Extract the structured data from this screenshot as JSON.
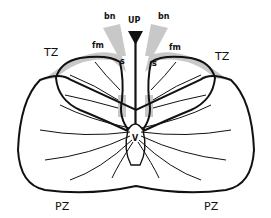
{
  "diagram": {
    "type": "anatomical-section",
    "labels": {
      "bn_left": "bn",
      "bn_right": "bn",
      "up": "UP",
      "tz_left": "TZ",
      "tz_right": "TZ",
      "fm_left": "fm",
      "fm_right": "fm",
      "s_left": "s",
      "s_right": "s",
      "v": "V",
      "pz_left": "PZ",
      "pz_right": "PZ"
    },
    "colors": {
      "outline": "#111111",
      "shaded": "#c8c8c8",
      "background": "#ffffff"
    }
  }
}
